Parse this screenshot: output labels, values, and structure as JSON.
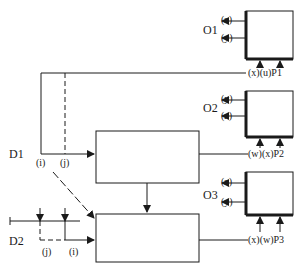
{
  "diagram": {
    "outputs": [
      {
        "id": "O1",
        "label": "O1",
        "out_top": "(z)",
        "out_bottom": "(y)",
        "input_row": "(x)(u)P1"
      },
      {
        "id": "O2",
        "label": "O2",
        "out_top": "(y)",
        "out_bottom": "(z)",
        "input_row": "(w)(x)P2"
      },
      {
        "id": "O3",
        "label": "O3",
        "out_top": "(z)",
        "out_bottom": "(y)",
        "input_row": "(x)(w)P3"
      }
    ],
    "decisions": [
      {
        "id": "D1",
        "label": "D1",
        "tags": [
          "(i)",
          "(j)"
        ]
      },
      {
        "id": "D2",
        "label": "D2",
        "tags": [
          "(j)",
          "(i)"
        ]
      }
    ],
    "colors": {
      "line": "#1a1a1a",
      "background": "#ffffff"
    }
  }
}
